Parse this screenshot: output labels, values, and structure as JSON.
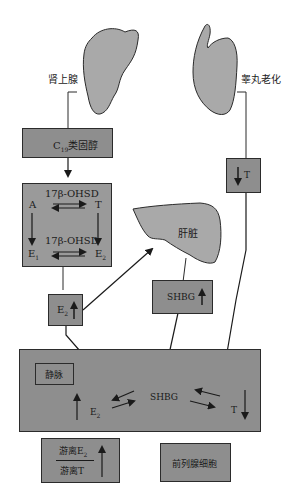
{
  "organs": {
    "adrenal_label": "肾上腺",
    "testis_label": "睾丸老化",
    "liver_label": "肝脏"
  },
  "boxes": {
    "c19_prefix": "C",
    "c19_sub": "19",
    "c19_suffix": "类固醇",
    "enzyme_top": "17β-OHSD",
    "enzyme_bottom": "17β-OHSD",
    "a": "A",
    "t": "T",
    "e1": "E",
    "e1_sub": "1",
    "e2": "E",
    "e2_sub": "2",
    "e2_up": "E",
    "e2_up_sub": "2",
    "t_down": "T",
    "shbg_up": "SHBG",
    "vein": "静脉",
    "blood_e2": "E",
    "blood_e2_sub": "2",
    "blood_shbg": "SHBG",
    "blood_t": "T",
    "ratio_num": "游离E",
    "ratio_num_sub": "2",
    "ratio_den": "游离T",
    "prostate": "前列腺细胞"
  },
  "colors": {
    "box_fill": "#8e8e8e",
    "organ_fill": "#a9a9a9",
    "stroke": "#2b2b2b"
  }
}
